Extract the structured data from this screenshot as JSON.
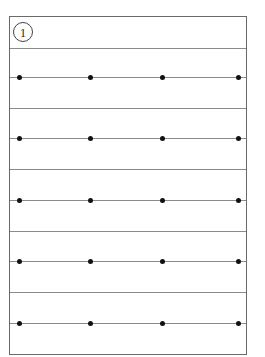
{
  "sheet": {
    "header": {
      "number": "1"
    },
    "rows": [
      {
        "dots_x": [
          9,
          80,
          152,
          228
        ]
      },
      {
        "dots_x": [
          9,
          80,
          152,
          228
        ]
      },
      {
        "dots_x": [
          9,
          80,
          152,
          228
        ]
      },
      {
        "dots_x": [
          9,
          80,
          152,
          228
        ]
      },
      {
        "dots_x": [
          9,
          80,
          152,
          228
        ]
      }
    ],
    "row_tops": [
      31,
      92,
      154,
      215,
      277
    ]
  },
  "colors": {
    "border": "#6a6a6a",
    "rule": "#8a8a8a",
    "dot": "#111111"
  }
}
